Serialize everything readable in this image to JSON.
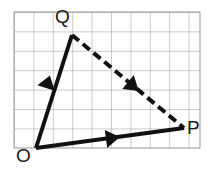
{
  "figure": {
    "name": "vector-triangle-on-grid",
    "width": 213,
    "height": 181,
    "background_color": "#ffffff"
  },
  "grid": {
    "line_color": "#9a9a9a",
    "line_width": 1,
    "cell_size": 19.4,
    "origin_x": 14,
    "origin_y": 12,
    "columns": 9,
    "rows": 7,
    "right_edge": 200,
    "bottom_edge": 148
  },
  "labels": {
    "o": "O",
    "p": "P",
    "q": "Q"
  },
  "points": {
    "O": {
      "x": 36,
      "y": 148
    },
    "P": {
      "x": 184,
      "y": 128
    },
    "Q": {
      "x": 72,
      "y": 35
    }
  },
  "vectors": [
    {
      "id": "OQ",
      "from": "O",
      "to": "Q",
      "style": "solid",
      "color": "#111111",
      "width": 4,
      "arrow_at": "midpoint",
      "arrow_x": 46,
      "arrow_y": 88
    },
    {
      "id": "OP",
      "from": "O",
      "to": "P",
      "style": "solid",
      "color": "#111111",
      "width": 4,
      "arrow_at": "midpoint",
      "arrow_x": 106,
      "arrow_y": 139
    },
    {
      "id": "QP",
      "from": "Q",
      "to": "P",
      "style": "dashed",
      "color": "#111111",
      "width": 4,
      "dash_pattern": "9 5",
      "arrow_at": "midpoint",
      "arrow_x": 128,
      "arrow_y": 82
    }
  ]
}
